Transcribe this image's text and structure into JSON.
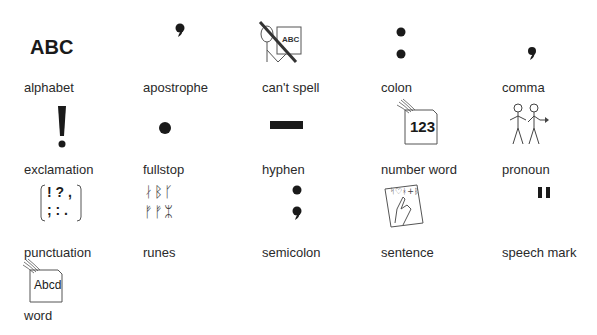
{
  "symbols": [
    {
      "label": "alphabet",
      "icon": "abc-text-icon",
      "glyph": "ABC"
    },
    {
      "label": "apostrophe",
      "icon": "apostrophe-icon"
    },
    {
      "label": "can't spell",
      "icon": "cant-spell-icon",
      "glyph": "ABC"
    },
    {
      "label": "colon",
      "icon": "colon-icon"
    },
    {
      "label": "comma",
      "icon": "comma-icon"
    },
    {
      "label": "exclamation",
      "icon": "exclamation-icon"
    },
    {
      "label": "fullstop",
      "icon": "fullstop-icon"
    },
    {
      "label": "hyphen",
      "icon": "hyphen-icon"
    },
    {
      "label": "number word",
      "icon": "number-card-icon",
      "glyph": "123"
    },
    {
      "label": "pronoun",
      "icon": "pronoun-people-icon"
    },
    {
      "label": "punctuation",
      "icon": "punctuation-bracket-icon",
      "glyph_top": "! ? ,",
      "glyph_bottom": "; : ."
    },
    {
      "label": "runes",
      "icon": "runes-icon",
      "glyph_top": "ᛅᛒᚴ",
      "glyph_bottom": "ᚠᚠᛯ"
    },
    {
      "label": "semicolon",
      "icon": "semicolon-icon"
    },
    {
      "label": "sentence",
      "icon": "sentence-hand-icon",
      "glyph": "ᛋ♡ᚼ+ᛒ"
    },
    {
      "label": "speech mark",
      "icon": "speech-mark-icon"
    },
    {
      "label": "word",
      "icon": "word-card-icon",
      "glyph": "Abcd"
    }
  ],
  "colors": {
    "ink": "#1a1a1a",
    "label": "#2a2a2a",
    "stroke": "#555555",
    "background": "#ffffff"
  }
}
